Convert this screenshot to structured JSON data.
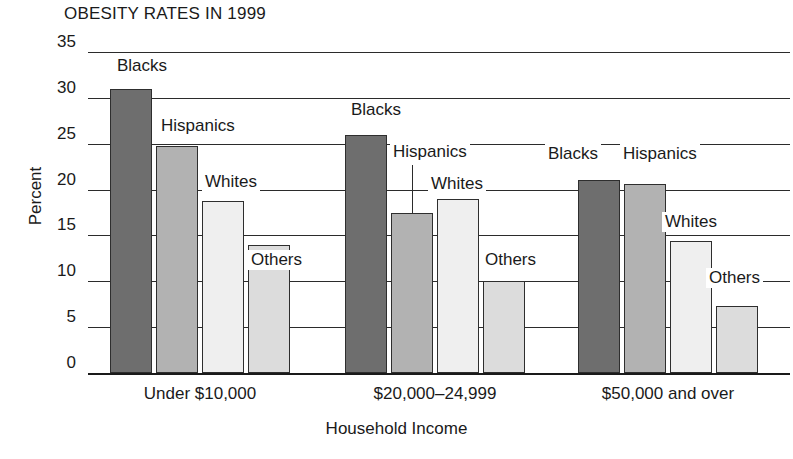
{
  "chart_data": {
    "type": "bar",
    "title": "OBESITY RATES IN 1999",
    "xlabel": "Household Income",
    "ylabel": "Percent",
    "ylim": [
      0,
      35
    ],
    "yticks": [
      0,
      5,
      10,
      15,
      20,
      25,
      30,
      35
    ],
    "grid": true,
    "legend": "inline-bar-labels",
    "categories": [
      "Under $10,000",
      "$20,000–24,999",
      "$50,000 and over"
    ],
    "series": [
      {
        "name": "Blacks",
        "color": "#6e6e6e",
        "values": [
          31.0,
          26.0,
          21.0
        ]
      },
      {
        "name": "Hispanics",
        "color": "#b2b2b2",
        "values": [
          24.8,
          17.5,
          20.6
        ]
      },
      {
        "name": "Whites",
        "color": "#efefef",
        "values": [
          18.8,
          19.0,
          14.4
        ]
      },
      {
        "name": "Others",
        "color": "#dcdcdc",
        "values": [
          14.0,
          10.0,
          7.3
        ]
      }
    ],
    "bar_labels": [
      {
        "text": "Blacks",
        "group": 0,
        "series": 0
      },
      {
        "text": "Hispanics",
        "group": 0,
        "series": 1
      },
      {
        "text": "Whites",
        "group": 0,
        "series": 2
      },
      {
        "text": "Others",
        "group": 0,
        "series": 3
      },
      {
        "text": "Blacks",
        "group": 1,
        "series": 0
      },
      {
        "text": "Hispanics",
        "group": 1,
        "series": 1
      },
      {
        "text": "Whites",
        "group": 1,
        "series": 2
      },
      {
        "text": "Others",
        "group": 1,
        "series": 3
      },
      {
        "text": "Blacks",
        "group": 2,
        "series": 0
      },
      {
        "text": "Hispanics",
        "group": 2,
        "series": 1
      },
      {
        "text": "Whites",
        "group": 2,
        "series": 2
      },
      {
        "text": "Others",
        "group": 2,
        "series": 3
      }
    ]
  },
  "ticks": {
    "t35": "35",
    "t30": "30",
    "t25": "25",
    "t20": "20",
    "t15": "15",
    "t10": "10",
    "t5": "5",
    "t0": "0"
  },
  "labels": {
    "title": "OBESITY RATES IN 1999",
    "ylabel": "Percent",
    "xlabel": "Household Income",
    "group0": "Under $10,000",
    "group1": "$20,000–24,999",
    "group2": "$50,000 and over",
    "blacks": "Blacks",
    "hispanics": "Hispanics",
    "whites": "Whites",
    "others": "Others"
  }
}
